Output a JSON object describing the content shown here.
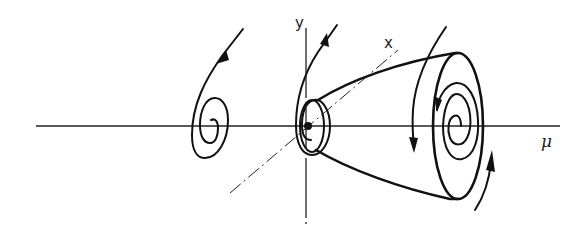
{
  "diagram": {
    "type": "Hopf bifurcation phase portrait",
    "axes": {
      "y_label": "y",
      "x_label": "x",
      "mu_label": "μ"
    },
    "elements": [
      "stable spiral (μ < 0)",
      "weak spiral at origin (μ = 0)",
      "paraboloid of limit cycles (μ > 0)",
      "outer limit cycle with inner unstable spiral"
    ],
    "colors": {
      "ink": "#111111",
      "background": "#ffffff"
    }
  }
}
